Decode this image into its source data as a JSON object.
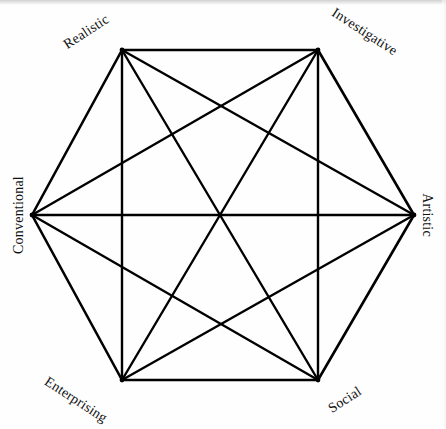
{
  "figure": {
    "background_color": "#fefefe",
    "line_color": "#000000",
    "label_color": "#111111"
  },
  "chart_data": {
    "type": "diagram",
    "subtype": "hexagon-network",
    "shape": "regular hexagon with all diagonals (complete graph K6)",
    "grid": false,
    "legend": "none",
    "node_count": 6,
    "edge_count": 15,
    "nodes": [
      {
        "id": "realistic",
        "label": "Realistic",
        "x": 122,
        "y": 50,
        "position": "top-left",
        "label_rotation_deg": -33,
        "label_x": 112,
        "label_y": 40
      },
      {
        "id": "investigative",
        "label": "Investigative",
        "x": 318,
        "y": 50,
        "position": "top-right",
        "label_rotation_deg": 33,
        "label_x": 327,
        "label_y": 40
      },
      {
        "id": "artistic",
        "label": "Artistic",
        "x": 414,
        "y": 215,
        "position": "right",
        "label_rotation_deg": 90,
        "label_x": 427,
        "label_y": 215
      },
      {
        "id": "social",
        "label": "Social",
        "x": 318,
        "y": 380,
        "position": "bottom-right",
        "label_rotation_deg": -33,
        "label_x": 327,
        "label_y": 392
      },
      {
        "id": "enterprising",
        "label": "Enterprising",
        "x": 122,
        "y": 380,
        "position": "bottom-left",
        "label_rotation_deg": 33,
        "label_x": 112,
        "label_y": 392
      },
      {
        "id": "conventional",
        "label": "Conventional",
        "x": 32,
        "y": 215,
        "position": "left",
        "label_rotation_deg": -90,
        "label_x": 19,
        "label_y": 215
      }
    ],
    "edges": [
      {
        "from": "realistic",
        "to": "investigative",
        "kind": "perimeter"
      },
      {
        "from": "investigative",
        "to": "artistic",
        "kind": "perimeter"
      },
      {
        "from": "artistic",
        "to": "social",
        "kind": "perimeter"
      },
      {
        "from": "social",
        "to": "enterprising",
        "kind": "perimeter"
      },
      {
        "from": "enterprising",
        "to": "conventional",
        "kind": "perimeter"
      },
      {
        "from": "conventional",
        "to": "realistic",
        "kind": "perimeter"
      },
      {
        "from": "realistic",
        "to": "artistic",
        "kind": "diagonal-short"
      },
      {
        "from": "realistic",
        "to": "social",
        "kind": "diagonal-long"
      },
      {
        "from": "realistic",
        "to": "enterprising",
        "kind": "diagonal-short"
      },
      {
        "from": "investigative",
        "to": "social",
        "kind": "diagonal-short"
      },
      {
        "from": "investigative",
        "to": "enterprising",
        "kind": "diagonal-long"
      },
      {
        "from": "investigative",
        "to": "conventional",
        "kind": "diagonal-short"
      },
      {
        "from": "artistic",
        "to": "enterprising",
        "kind": "diagonal-short"
      },
      {
        "from": "artistic",
        "to": "conventional",
        "kind": "diagonal-long"
      },
      {
        "from": "social",
        "to": "conventional",
        "kind": "diagonal-short"
      }
    ],
    "center": {
      "x": 223,
      "y": 215
    }
  }
}
